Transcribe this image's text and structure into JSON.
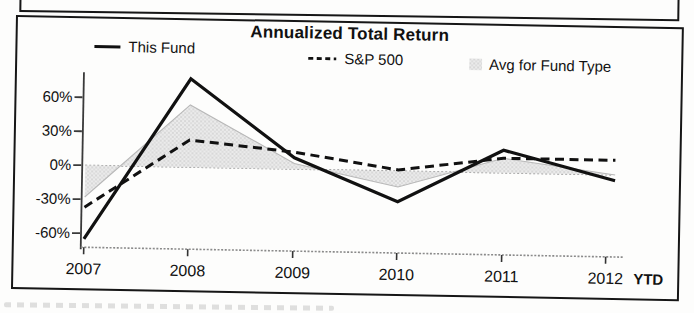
{
  "title": "Annualized Total Return",
  "legend": {
    "this_fund": "This Fund",
    "sp500": "S&P 500",
    "avg_fund_type": "Avg for Fund Type"
  },
  "chart_data": {
    "type": "line",
    "title": "Annualized Total Return",
    "categories": [
      "2007",
      "2008",
      "2009",
      "2010",
      "2011",
      "2012"
    ],
    "ytd_label": "YTD",
    "series": [
      {
        "name": "This Fund",
        "line_style": "solid",
        "color": "#111111",
        "values": [
          -65,
          78,
          10,
          -27,
          20,
          -5
        ]
      },
      {
        "name": "S&P 500",
        "line_style": "dashed",
        "color": "#111111",
        "values": [
          -37,
          24,
          15,
          1,
          13,
          13
        ]
      },
      {
        "name": "Avg for Fund Type",
        "line_style": "filled-area-to-zero",
        "color": "#e6e6e6",
        "values": [
          -28,
          55,
          5,
          -14,
          13,
          0
        ]
      }
    ],
    "ytick_labels": [
      "60%",
      "30%",
      "0%",
      "-30%",
      "-60%"
    ],
    "ytick_values": [
      60,
      30,
      0,
      -30,
      -60
    ],
    "ylim": [
      -72,
      79
    ],
    "unit": "%",
    "legend_position": "top",
    "grid": "dotted-zero-line-only"
  },
  "colors": {
    "line": "#111111",
    "area_fill": "#ebebeb",
    "area_dots": "#c0c0c0",
    "area_edge": "#b8b8b8",
    "zero_line": "#9a9a9a",
    "axis": "#3a3a3a",
    "box_border": "#161616",
    "background": "#fdfdfc"
  }
}
